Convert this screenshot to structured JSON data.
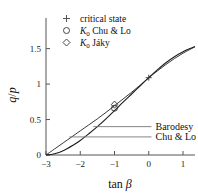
{
  "chart_data": {
    "type": "line",
    "title": "",
    "xlabel": "tan β",
    "ylabel": "q/p",
    "xlim": [
      -3,
      1.35
    ],
    "ylim": [
      0,
      1.72
    ],
    "grid": false,
    "xticks": [
      -3,
      -2,
      -1,
      0,
      1
    ],
    "xticklabels": [
      "−3",
      "−2",
      "−1",
      "0",
      "1"
    ],
    "yticks": [
      0,
      0.5,
      1,
      1.5
    ],
    "yticklabels": [
      "0",
      "0.5",
      "1",
      "1.5"
    ],
    "legend_position": "top-center",
    "series": [
      {
        "name": "Barodesy",
        "x": [
          -3.0,
          -2.75,
          -2.5,
          -2.25,
          -2.0,
          -1.75,
          -1.5,
          -1.25,
          -1.0,
          -0.75,
          -0.5,
          -0.25,
          0.0,
          0.25,
          0.5,
          0.75,
          1.0,
          1.25,
          1.35
        ],
        "y": [
          0.0,
          0.085,
          0.17,
          0.255,
          0.34,
          0.425,
          0.51,
          0.6,
          0.695,
          0.79,
          0.885,
          0.985,
          1.09,
          1.185,
          1.275,
          1.36,
          1.435,
          1.5,
          1.525
        ]
      },
      {
        "name": "Chu & Lo",
        "x": [
          -3.0,
          -2.85,
          -2.7,
          -2.55,
          -2.4,
          -2.2,
          -2.0,
          -1.75,
          -1.5,
          -1.25,
          -1.0,
          -0.75,
          -0.5,
          -0.25,
          0.0,
          0.25,
          0.5,
          0.75,
          1.0,
          1.25,
          1.35
        ],
        "y": [
          0.0,
          0.008,
          0.025,
          0.05,
          0.085,
          0.14,
          0.205,
          0.3,
          0.4,
          0.51,
          0.625,
          0.745,
          0.86,
          0.975,
          1.09,
          1.2,
          1.3,
          1.385,
          1.455,
          1.51,
          1.53
        ]
      }
    ],
    "markers": [
      {
        "type": "plus",
        "label": "critical state",
        "x": 0.0,
        "y": 1.09
      },
      {
        "type": "circle",
        "label": "K0 Chu & Lo",
        "x": -1.0,
        "y": 0.66
      },
      {
        "type": "diamond",
        "label": "K0 Jaky",
        "x": -1.0,
        "y": 0.71
      }
    ],
    "annotations": [
      {
        "text": "Barodesy",
        "x": 0.05,
        "y": 0.4
      },
      {
        "text": "Chu & Lo",
        "x": 0.05,
        "y": 0.255
      }
    ]
  },
  "legend": {
    "items": [
      {
        "marker_glyph": "+",
        "marker_name": "plus-marker-icon",
        "label": "critical state"
      },
      {
        "marker_glyph": "○",
        "marker_name": "circle-marker-icon",
        "label_k": "K",
        "label_sub": "0",
        "label_rest": " Chu & Lo"
      },
      {
        "marker_glyph": "◇",
        "marker_name": "diamond-marker-icon",
        "label_k": "K",
        "label_sub": "0",
        "label_rest": " Jáky"
      }
    ]
  },
  "axes": {
    "x_title_main": "tan",
    "x_title_symbol": "β",
    "y_title_num": "q",
    "y_title_slash": "/",
    "y_title_den": "p"
  },
  "annotations_labels": {
    "barodesy": "Barodesy",
    "chulo": "Chu & Lo"
  },
  "colors": {
    "axis": "#555555",
    "barodesy": "#3a3a3a",
    "chulo": "#1c1c1c",
    "text": "#111111",
    "background": "#ffffff"
  }
}
